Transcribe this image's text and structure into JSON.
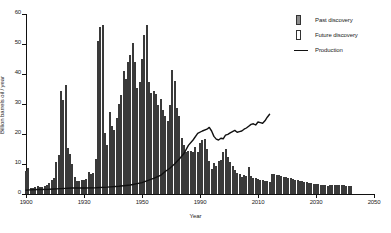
{
  "chart_data": {
    "type": "bar",
    "title": "",
    "xlabel": "Year",
    "ylabel": "Billion barrels oil / year",
    "xlim": [
      1900,
      2050
    ],
    "ylim": [
      0,
      60
    ],
    "yticks": [
      0,
      10,
      20,
      30,
      40,
      50,
      60
    ],
    "xticks": [
      1900,
      1930,
      1950,
      1990,
      2010,
      2030,
      2050
    ],
    "xtick_labels": [
      "1900",
      "1930",
      "1950",
      "1990",
      "2010",
      "2030",
      "2050"
    ],
    "grid": false,
    "legend_position": "top-right",
    "legend": [
      {
        "key": "past",
        "label": "Past discovery",
        "marker": "filled-bar",
        "color": "#8d8d8d"
      },
      {
        "key": "future",
        "label": "Future discovery",
        "marker": "open-bar",
        "color": "#ffffff"
      },
      {
        "key": "production",
        "label": "Production",
        "marker": "line",
        "color": "#111111"
      }
    ],
    "series": [
      {
        "name": "Past discovery",
        "type": "bar",
        "style": "filled",
        "color": "#8d8d8d",
        "x": [
          1900,
          1901,
          1902,
          1903,
          1904,
          1905,
          1906,
          1907,
          1908,
          1909,
          1910,
          1911,
          1912,
          1913,
          1914,
          1915,
          1916,
          1917,
          1918,
          1919,
          1920,
          1921,
          1922,
          1923,
          1924,
          1925,
          1926,
          1927,
          1928,
          1929,
          1930,
          1931,
          1932,
          1933,
          1934,
          1935,
          1936,
          1937,
          1938,
          1939,
          1940,
          1941,
          1942,
          1943,
          1944,
          1945,
          1946,
          1947,
          1948,
          1949,
          1950,
          1951,
          1952,
          1953,
          1954,
          1955,
          1956,
          1957,
          1958,
          1959,
          1960,
          1961,
          1962,
          1963,
          1964,
          1965,
          1966,
          1967,
          1968,
          1969,
          1970,
          1971,
          1972,
          1973,
          1974,
          1975,
          1976,
          1977,
          1978,
          1979,
          1980,
          1981,
          1982,
          1983,
          1984,
          1985,
          1986,
          1987,
          1988,
          1989,
          1990,
          1991,
          1992,
          1993,
          1994,
          1995,
          1996,
          1997,
          1998,
          1999,
          2000,
          2001,
          2002,
          2003,
          2004,
          2005
        ],
        "values": [
          7.6,
          8.8,
          2.0,
          2.1,
          2.4,
          2.6,
          2.3,
          2.4,
          2.6,
          3.0,
          3.6,
          4.6,
          5.4,
          10.8,
          13.0,
          34.4,
          31.2,
          36.2,
          15.5,
          13.2,
          10.1,
          5.6,
          4.4,
          4.3,
          4.6,
          4.8,
          5.1,
          7.4,
          6.6,
          7.1,
          11.8,
          50.9,
          55.8,
          56.3,
          20.5,
          16.2,
          27.4,
          22.6,
          21.2,
          25.3,
          29.9,
          33.1,
          41.0,
          38.3,
          44.0,
          46.2,
          50.2,
          43.9,
          35.4,
          37.3,
          45.0,
          52.9,
          56.3,
          37.5,
          33.8,
          34.5,
          33.2,
          29.8,
          31.7,
          28.0,
          26.0,
          24.4,
          29.7,
          41.2,
          37.6,
          28.6,
          25.9,
          18.6,
          16.2,
          14.0,
          14.4,
          14.5,
          13.9,
          15.8,
          13.9,
          17.1,
          17.9,
          18.5,
          15.0,
          10.9,
          8.4,
          10.4,
          9.4,
          11.0,
          11.3,
          14.0,
          15.0,
          12.2,
          10.8,
          9.3,
          8.0,
          7.0,
          6.6,
          5.6,
          6.2,
          6.0,
          8.9,
          6.0,
          5.5,
          5.2,
          5.0,
          4.8,
          4.6,
          4.4,
          4.2,
          4.0
        ]
      },
      {
        "name": "Future discovery",
        "type": "bar",
        "style": "open",
        "color": "#ffffff",
        "x": [
          2006,
          2007,
          2008,
          2009,
          2010,
          2011,
          2012,
          2013,
          2014,
          2015,
          2016,
          2017,
          2018,
          2019,
          2020,
          2021,
          2022,
          2023,
          2024,
          2025,
          2026,
          2027,
          2028,
          2029,
          2030,
          2031,
          2032,
          2033,
          2034,
          2035,
          2036,
          2037,
          2038,
          2039,
          2040
        ],
        "values": [
          6.7,
          6.6,
          6.4,
          6.2,
          6.0,
          5.8,
          5.6,
          5.4,
          5.2,
          5.0,
          4.8,
          4.6,
          4.4,
          4.2,
          4.0,
          3.9,
          3.7,
          3.6,
          3.4,
          3.3,
          3.2,
          3.1,
          3.0,
          2.9,
          2.8,
          3.0,
          3.0,
          3.0,
          3.0,
          3.0,
          3.0,
          3.0,
          2.6,
          2.6,
          2.6
        ]
      },
      {
        "name": "Production",
        "type": "line",
        "color": "#111111",
        "x": [
          1900,
          1905,
          1910,
          1915,
          1920,
          1925,
          1930,
          1935,
          1940,
          1945,
          1950,
          1955,
          1958,
          1960,
          1962,
          1964,
          1966,
          1968,
          1970,
          1972,
          1974,
          1976,
          1978,
          1979,
          1980,
          1981,
          1982,
          1983,
          1984,
          1985,
          1986,
          1987,
          1988,
          1989,
          1990,
          1991,
          1992,
          1993,
          1994,
          1995,
          1996,
          1997,
          1998,
          1999,
          2000,
          2001,
          2002,
          2003,
          2004,
          2005
        ],
        "values": [
          1.3,
          1.5,
          1.6,
          1.8,
          2.0,
          2.0,
          2.1,
          2.3,
          2.6,
          3.0,
          3.8,
          5.2,
          6.2,
          7.5,
          8.6,
          10.0,
          11.6,
          13.4,
          16.2,
          18.0,
          20.2,
          21.0,
          21.6,
          22.2,
          21.0,
          19.2,
          18.3,
          18.0,
          18.6,
          18.4,
          19.6,
          19.9,
          20.4,
          20.8,
          21.2,
          20.6,
          20.8,
          21.0,
          21.6,
          22.0,
          22.6,
          23.2,
          23.4,
          23.0,
          24.0,
          23.8,
          23.6,
          24.4,
          25.6,
          26.6
        ]
      }
    ]
  },
  "axes": {
    "y_label_text": "Billion barrels oil / year",
    "x_label_text": "Year"
  }
}
